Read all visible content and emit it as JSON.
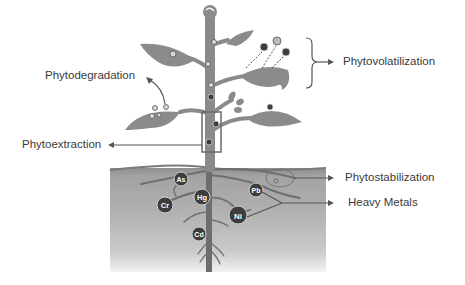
{
  "labels": {
    "phytodegradation": "Phytodegradation",
    "phytovolatilization": "Phytovolatilization",
    "phytoextraction": "Phytoextraction",
    "phytostabilization": "Phytostabilization",
    "heavy_metals": "Heavy Metals"
  },
  "metals": [
    {
      "symbol": "As",
      "x": 181,
      "y": 178,
      "r": 7
    },
    {
      "symbol": "Hg",
      "x": 202,
      "y": 197,
      "r": 8
    },
    {
      "symbol": "Cr",
      "x": 165,
      "y": 205,
      "r": 8
    },
    {
      "symbol": "Pb",
      "x": 256,
      "y": 189,
      "r": 7
    },
    {
      "symbol": "Ni",
      "x": 238,
      "y": 215,
      "r": 9
    },
    {
      "symbol": "Cd",
      "x": 199,
      "y": 233,
      "r": 7
    }
  ],
  "colors": {
    "plant": "#8a8a8a",
    "plant_dark": "#6e6e6e",
    "ion": "#3d3d3d",
    "soil_top": "#9c9c9c",
    "soil_mid": "#ababab",
    "soil_bottom": "#c4c4c4",
    "text": "#3a3a3a",
    "arrow": "#555555"
  }
}
